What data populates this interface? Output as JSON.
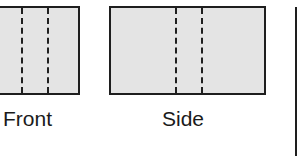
{
  "diagram": {
    "type": "orthographic-projection",
    "views": [
      {
        "id": "front",
        "label": "Front",
        "hidden_lines": 2
      },
      {
        "id": "side",
        "label": "Side",
        "hidden_lines": 2
      },
      {
        "id": "top",
        "label": "",
        "partially_visible": true
      }
    ],
    "colors": {
      "outline": "#1e1e1e",
      "fill": "#e4e4e4",
      "background": "#ffffff",
      "text": "#1a1a1a"
    }
  }
}
